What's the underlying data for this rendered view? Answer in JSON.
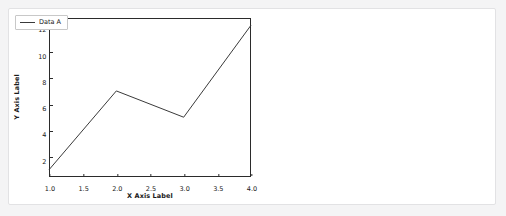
{
  "figure": {
    "background_color": "#ffffff",
    "page_background_color": "#f4f4f5",
    "border_color": "#e2e2e4"
  },
  "chart_data": {
    "type": "line",
    "title": "",
    "xlabel": "X Axis Label",
    "ylabel": "Y Axis Label",
    "xlim": [
      1.0,
      4.0
    ],
    "ylim": [
      0.45,
      12.55
    ],
    "xticks": [
      "1.0",
      "1.5",
      "2.0",
      "2.5",
      "3.0",
      "3.5",
      "4.0"
    ],
    "xtick_values": [
      1.0,
      1.5,
      2.0,
      2.5,
      3.0,
      3.5,
      4.0
    ],
    "yticks": [
      "2",
      "4",
      "6",
      "8",
      "10",
      "12"
    ],
    "ytick_values": [
      2,
      4,
      6,
      8,
      10,
      12
    ],
    "grid": false,
    "legend_position": "upper left",
    "series": [
      {
        "name": "Data A",
        "color": "#3a3a3a",
        "linewidth": 1,
        "x": [
          1,
          2,
          3,
          4
        ],
        "values": [
          1,
          7,
          5,
          12
        ]
      }
    ]
  },
  "legend": {
    "entries": [
      {
        "label": "Data A",
        "color": "#3a3a3a"
      }
    ]
  }
}
